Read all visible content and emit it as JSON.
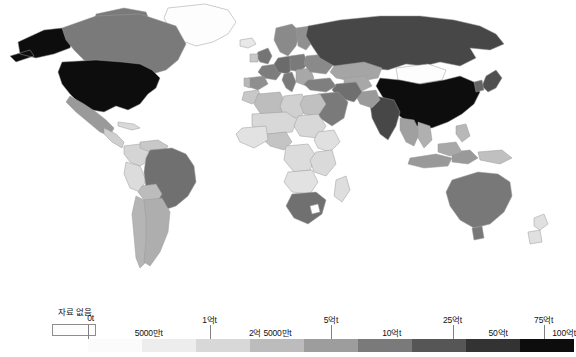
{
  "figure": {
    "type": "choropleth-world-map",
    "projection": "robinson",
    "background": "#ffffff"
  },
  "legend": {
    "nodata": {
      "label": "자료 없음",
      "color": "#fdfdfd",
      "border_color": "#8d8d8d"
    },
    "title": "",
    "unit": "t",
    "scale_type": "graduated-discrete",
    "breaks": [
      "0t",
      "5000만t",
      "1억t",
      "2억 5000만t",
      "5억t",
      "10억t",
      "25억t",
      "50억t",
      "75억t",
      "100억t"
    ],
    "tick_marks": [
      {
        "label": "0t",
        "pos_pct": 0,
        "row": "upper",
        "has_line": true
      },
      {
        "label": "1억t",
        "pos_pct": 25,
        "row": "upper",
        "has_line": true
      },
      {
        "label": "5억t",
        "pos_pct": 50,
        "row": "upper",
        "has_line": true
      },
      {
        "label": "25억t",
        "pos_pct": 75,
        "row": "upper",
        "has_line": true
      },
      {
        "label": "75억t",
        "pos_pct": 93.75,
        "row": "upper",
        "has_line": true
      }
    ],
    "segment_labels": [
      {
        "label": "5000만t",
        "pos_pct": 12.5,
        "row": "lower"
      },
      {
        "label": "2억 5000만t",
        "pos_pct": 37.5,
        "row": "lower"
      },
      {
        "label": "10억t",
        "pos_pct": 62.5,
        "row": "lower"
      },
      {
        "label": "50억t",
        "pos_pct": 84.38,
        "row": "lower"
      },
      {
        "label": "100억t",
        "pos_pct": 100,
        "row": "lower"
      }
    ],
    "swatch_colors": [
      "#fbfbfb",
      "#ededed",
      "#d8d8d8",
      "#bcbcbc",
      "#9d9d9d",
      "#7a7a7a",
      "#565656",
      "#333333",
      "#0d0d0d"
    ]
  },
  "chart_data": {
    "type": "heatmap",
    "title": "",
    "xlabel": "",
    "ylabel": "",
    "value_unit": "t",
    "color_scale": [
      "#fbfbfb",
      "#ededed",
      "#d8d8d8",
      "#bcbcbc",
      "#9d9d9d",
      "#7a7a7a",
      "#565656",
      "#333333",
      "#0d0d0d"
    ],
    "bins": [
      "0t",
      "5000만t",
      "1억t",
      "2억 5000만t",
      "5억t",
      "10억t",
      "25억t",
      "50억t",
      "75억t",
      "100억t"
    ],
    "nodata_color": "#fdfdfd",
    "regions": [
      {
        "name": "United States",
        "bin": 8,
        "color": "#0d0d0d"
      },
      {
        "name": "China",
        "bin": 8,
        "color": "#0d0d0d"
      },
      {
        "name": "Alaska",
        "bin": 8,
        "color": "#0d0d0d"
      },
      {
        "name": "Russia",
        "bin": 6,
        "color": "#474747"
      },
      {
        "name": "India",
        "bin": 6,
        "color": "#474747"
      },
      {
        "name": "Canada",
        "bin": 5,
        "color": "#7a7a7a"
      },
      {
        "name": "Japan",
        "bin": 6,
        "color": "#4f4f4f"
      },
      {
        "name": "Germany",
        "bin": 5,
        "color": "#6b6b6b"
      },
      {
        "name": "United Kingdom",
        "bin": 5,
        "color": "#757575"
      },
      {
        "name": "France",
        "bin": 5,
        "color": "#7d7d7d"
      },
      {
        "name": "Italy",
        "bin": 5,
        "color": "#7a7a7a"
      },
      {
        "name": "Spain",
        "bin": 4,
        "color": "#8f8f8f"
      },
      {
        "name": "Poland",
        "bin": 5,
        "color": "#7a7a7a"
      },
      {
        "name": "Ukraine",
        "bin": 5,
        "color": "#8a8a8a"
      },
      {
        "name": "Turkey",
        "bin": 5,
        "color": "#7f7f7f"
      },
      {
        "name": "Iran",
        "bin": 5,
        "color": "#6f6f6f"
      },
      {
        "name": "Saudi Arabia",
        "bin": 5,
        "color": "#7a7a7a"
      },
      {
        "name": "Kazakhstan",
        "bin": 4,
        "color": "#a5a5a5"
      },
      {
        "name": "Brazil",
        "bin": 5,
        "color": "#707070"
      },
      {
        "name": "Mexico",
        "bin": 4,
        "color": "#9a9a9a"
      },
      {
        "name": "Argentina",
        "bin": 3,
        "color": "#aeaeae"
      },
      {
        "name": "South Africa",
        "bin": 5,
        "color": "#707070"
      },
      {
        "name": "Australia",
        "bin": 5,
        "color": "#787878"
      },
      {
        "name": "Indonesia",
        "bin": 4,
        "color": "#999999"
      },
      {
        "name": "Thailand",
        "bin": 4,
        "color": "#a0a0a0"
      },
      {
        "name": "Egypt",
        "bin": 3,
        "color": "#c0c0c0"
      },
      {
        "name": "Algeria",
        "bin": 3,
        "color": "#bdbdbd"
      },
      {
        "name": "Nigeria",
        "bin": 3,
        "color": "#c4c4c4"
      },
      {
        "name": "Greenland",
        "bin": -1,
        "color": "#fdfdfd"
      },
      {
        "name": "Mongolia",
        "bin": -1,
        "color": "#fdfdfd"
      },
      {
        "name": "Peru",
        "bin": 2,
        "color": "#dcdcdc"
      },
      {
        "name": "Colombia",
        "bin": 2,
        "color": "#d5d5d5"
      },
      {
        "name": "Chile",
        "bin": 3,
        "color": "#b5b5b5"
      }
    ]
  }
}
